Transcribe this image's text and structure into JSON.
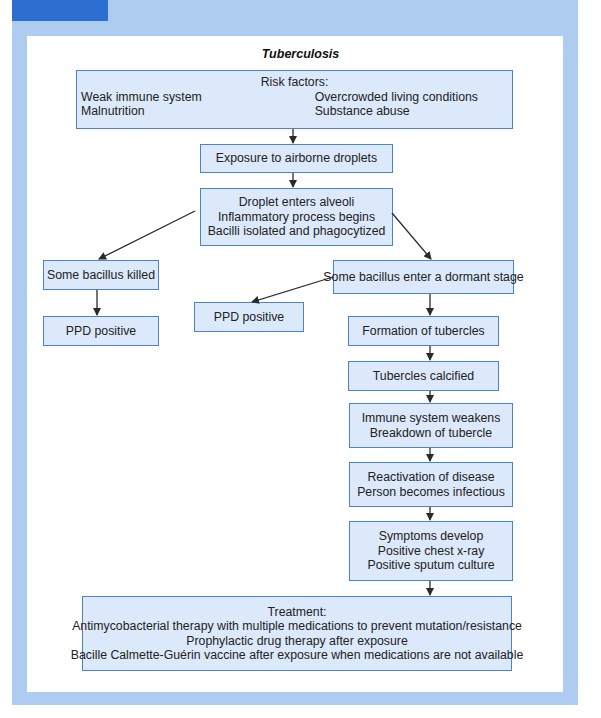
{
  "header": {
    "tab_color": "#2c6fd1",
    "frame_color": "#aecbf0"
  },
  "diagram": {
    "title": "Tuberculosis",
    "colors": {
      "box_fill": "#dce9fb",
      "box_border": "#4a82d6",
      "arrow": "#2a2a2a"
    },
    "risk_factors": {
      "heading": "Risk factors:",
      "left": [
        "Weak immune system",
        "Malnutrition"
      ],
      "right": [
        "Overcrowded living conditions",
        "Substance abuse"
      ]
    },
    "exposure": {
      "lines": [
        "Exposure to airborne droplets"
      ]
    },
    "droplet": {
      "lines": [
        "Droplet enters alveoli",
        "Inflammatory process begins",
        "Bacilli isolated and phagocytized"
      ]
    },
    "killed": {
      "lines": [
        "Some bacillus killed"
      ]
    },
    "ppd_left": {
      "lines": [
        "PPD positive"
      ]
    },
    "dormant": {
      "lines": [
        "Some bacillus enter a dormant stage"
      ]
    },
    "ppd_mid": {
      "lines": [
        "PPD positive"
      ]
    },
    "formation": {
      "lines": [
        "Formation of tubercles"
      ]
    },
    "calcified": {
      "lines": [
        "Tubercles calcified"
      ]
    },
    "immune": {
      "lines": [
        "Immune system weakens",
        "Breakdown of tubercle"
      ]
    },
    "reactivation": {
      "lines": [
        "Reactivation of disease",
        "Person becomes infectious"
      ]
    },
    "symptoms": {
      "lines": [
        "Symptoms develop",
        "Positive chest x-ray",
        "Positive sputum culture"
      ]
    },
    "treatment": {
      "lines": [
        "Treatment:",
        "Antimycobacterial therapy with multiple medications to prevent mutation/resistance",
        "Prophylactic drug therapy after exposure",
        "Bacille Calmette-Guérin vaccine after exposure when medications are not available"
      ]
    },
    "edges": [
      {
        "from": "risk_factors",
        "to": "exposure"
      },
      {
        "from": "exposure",
        "to": "droplet"
      },
      {
        "from": "droplet",
        "to": "killed"
      },
      {
        "from": "droplet",
        "to": "dormant"
      },
      {
        "from": "killed",
        "to": "ppd_left"
      },
      {
        "from": "dormant",
        "to": "ppd_mid"
      },
      {
        "from": "dormant",
        "to": "formation"
      },
      {
        "from": "formation",
        "to": "calcified"
      },
      {
        "from": "calcified",
        "to": "immune"
      },
      {
        "from": "immune",
        "to": "reactivation"
      },
      {
        "from": "reactivation",
        "to": "symptoms"
      },
      {
        "from": "symptoms",
        "to": "treatment"
      }
    ]
  }
}
